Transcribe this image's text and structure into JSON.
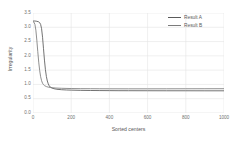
{
  "chart_data": {
    "type": "line",
    "title": "",
    "xlabel": "Sorted centers",
    "ylabel": "Irregularity",
    "xlim": [
      0,
      1000
    ],
    "ylim": [
      0.0,
      3.5
    ],
    "xticks": [
      "0",
      "200",
      "400",
      "600",
      "800",
      "1000"
    ],
    "xtick_values": [
      0,
      200,
      400,
      600,
      800,
      1000
    ],
    "yticks": [
      "0.0",
      "0.5",
      "1.0",
      "1.5",
      "2.0",
      "2.5",
      "3.0",
      "3.5"
    ],
    "ytick_values": [
      0.0,
      0.5,
      1.0,
      1.5,
      2.0,
      2.5,
      3.0,
      3.5
    ],
    "grid": true,
    "grid_color": "#e4e4e4",
    "legend_position": "top-right",
    "series": [
      {
        "name": "Result A",
        "color": "#5a5a5a",
        "x": [
          0,
          10,
          20,
          30,
          35,
          40,
          45,
          50,
          55,
          60,
          65,
          70,
          75,
          80,
          85,
          90,
          100,
          110,
          125,
          150,
          175,
          200,
          250,
          300,
          350,
          400,
          450,
          500,
          600,
          700,
          800,
          900,
          1000
        ],
        "y": [
          3.22,
          3.22,
          3.21,
          3.19,
          3.16,
          3.1,
          2.95,
          2.65,
          2.25,
          1.85,
          1.52,
          1.28,
          1.12,
          1.02,
          0.95,
          0.91,
          0.87,
          0.85,
          0.83,
          0.815,
          0.806,
          0.8,
          0.792,
          0.788,
          0.785,
          0.783,
          0.781,
          0.78,
          0.779,
          0.778,
          0.778,
          0.777,
          0.777
        ]
      },
      {
        "name": "Result B",
        "color": "#7b7b7b",
        "x": [
          0,
          5,
          10,
          15,
          20,
          25,
          30,
          35,
          40,
          45,
          50,
          55,
          60,
          70,
          80,
          90,
          100,
          120,
          150,
          200,
          250,
          300,
          350,
          400,
          500,
          600,
          700,
          800,
          900,
          1000
        ],
        "y": [
          3.2,
          3.18,
          3.1,
          2.9,
          2.55,
          2.15,
          1.78,
          1.48,
          1.27,
          1.13,
          1.04,
          0.99,
          0.96,
          0.925,
          0.905,
          0.893,
          0.885,
          0.873,
          0.864,
          0.856,
          0.852,
          0.85,
          0.848,
          0.847,
          0.846,
          0.846,
          0.847,
          0.848,
          0.849,
          0.85
        ]
      }
    ]
  },
  "legend": {
    "items": [
      {
        "label": "Result A"
      },
      {
        "label": "Result B"
      }
    ]
  },
  "axes": {
    "x_title": "Sorted centers",
    "y_title": "Irregularity"
  }
}
